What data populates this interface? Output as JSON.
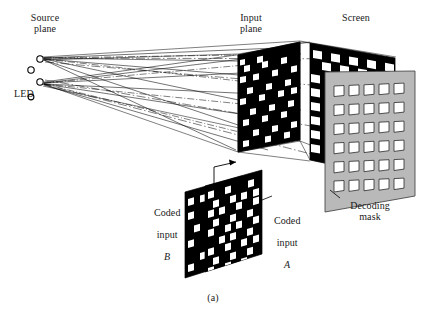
{
  "figure": {
    "caption": "(a)",
    "background_color": "#ffffff",
    "ink_color": "#000000",
    "mask_gray": "#b9b9b9",
    "title_font_size_px": 10
  },
  "labels": {
    "source_plane": "Source\nplane",
    "led": "LED",
    "input_plane": "Input\nplane",
    "screen": "Screen",
    "coded_input_b_line1": "Coded",
    "coded_input_b_line2": "input",
    "coded_input_b_line3": "B",
    "coded_input_a_line1": "Coded",
    "coded_input_a_line2": "input",
    "coded_input_a_line3": "A",
    "decoding_mask": "Decoding\nmask"
  },
  "source_plane": {
    "led_count": 3,
    "leds": [
      {
        "cx": 40,
        "cy": 59,
        "r": 3.2,
        "emitting": true
      },
      {
        "cx": 31,
        "cy": 70,
        "r": 3.2,
        "emitting": false
      },
      {
        "cx": 40,
        "cy": 82,
        "r": 3.2,
        "emitting": true
      }
    ]
  },
  "input_plane": {
    "description": "black coded aperture panel with scattered transparent cells",
    "grid_cols": 9,
    "grid_rows": 9,
    "open_cells": [
      [
        0,
        1
      ],
      [
        0,
        4
      ],
      [
        0,
        7
      ],
      [
        1,
        0
      ],
      [
        1,
        2
      ],
      [
        1,
        3
      ],
      [
        1,
        6
      ],
      [
        1,
        8
      ],
      [
        2,
        1
      ],
      [
        2,
        5
      ],
      [
        2,
        7
      ],
      [
        3,
        0
      ],
      [
        3,
        2
      ],
      [
        3,
        4
      ],
      [
        3,
        8
      ],
      [
        4,
        1
      ],
      [
        4,
        3
      ],
      [
        4,
        6
      ],
      [
        4,
        7
      ],
      [
        5,
        0
      ],
      [
        5,
        2
      ],
      [
        5,
        5
      ],
      [
        5,
        8
      ],
      [
        6,
        1
      ],
      [
        6,
        3
      ],
      [
        6,
        4
      ],
      [
        6,
        7
      ],
      [
        7,
        0
      ],
      [
        7,
        2
      ],
      [
        7,
        6
      ],
      [
        7,
        8
      ],
      [
        8,
        1
      ],
      [
        8,
        3
      ],
      [
        8,
        5
      ],
      [
        8,
        7
      ]
    ]
  },
  "screen": {
    "description": "black screen with white correlation spots at border",
    "grid_cols": 7,
    "grid_rows": 9
  },
  "decoding_mask": {
    "description": "gray plate with 6 by 6 array of square openings",
    "fill": "#b9b9b9",
    "grid_cols": 6,
    "grid_rows": 6
  },
  "coded_input_a": {
    "grid_cols": 11,
    "grid_rows": 11,
    "label": "A"
  },
  "coded_input_b": {
    "grid_cols": 11,
    "grid_rows": 11,
    "label": "B"
  },
  "rays": {
    "count": 10,
    "style": "thin solid and dash-dot lines from LEDs to input plane and screen"
  }
}
